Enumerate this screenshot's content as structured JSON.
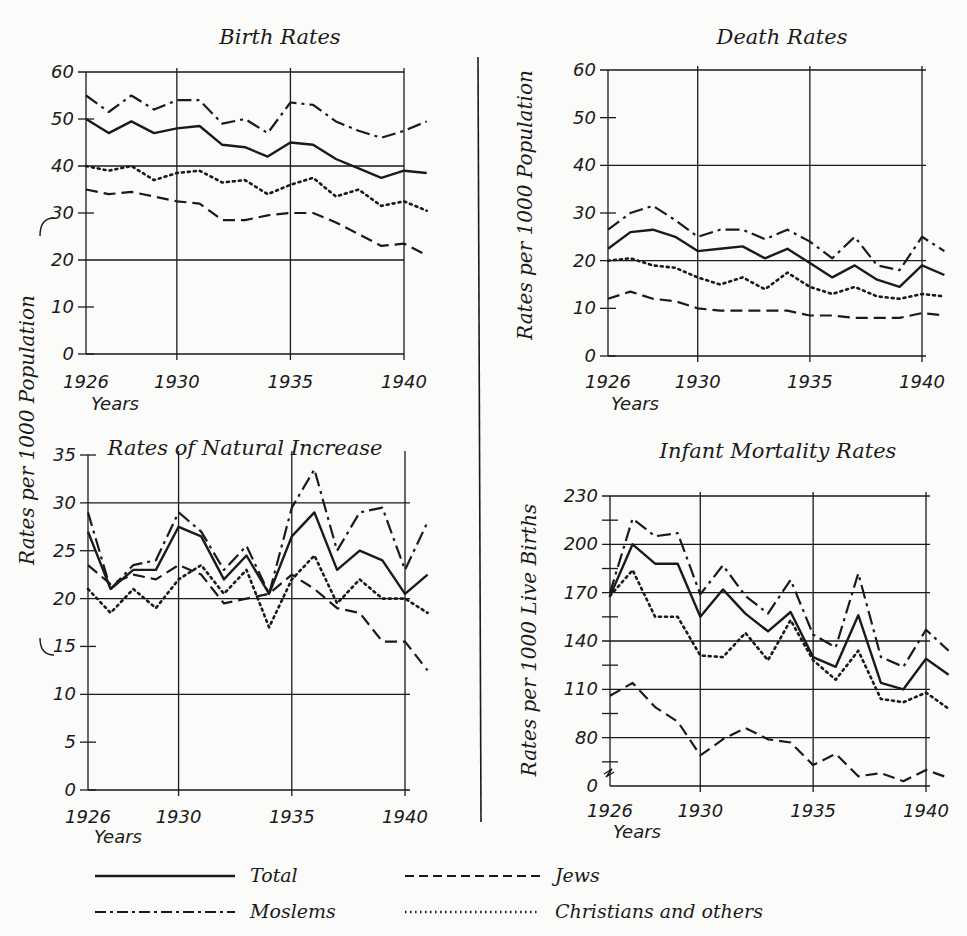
{
  "legend": [
    {
      "key": "total",
      "label": "Total",
      "style": "solid"
    },
    {
      "key": "jews",
      "label": "Jews",
      "style": "dashed"
    },
    {
      "key": "moslems",
      "label": "Moslems",
      "style": "dash-dot"
    },
    {
      "key": "christians",
      "label": "Christians and others",
      "style": "dotted"
    }
  ],
  "shared_ylabel_left": "Rates per 1000 Population",
  "chart_data": [
    {
      "type": "line",
      "title": "Birth Rates",
      "xlabel": "Years",
      "ylabel": "Rates per 1000 Population",
      "x": [
        1926,
        1927,
        1928,
        1929,
        1930,
        1931,
        1932,
        1933,
        1934,
        1935,
        1936,
        1937,
        1938,
        1939,
        1940,
        1941
      ],
      "xticks": [
        "1926",
        "1930",
        "1935",
        "1940"
      ],
      "yticks": [
        "0",
        "10",
        "20",
        "30",
        "40",
        "50",
        "60"
      ],
      "ylim": [
        0,
        60
      ],
      "series": [
        {
          "name": "Moslems",
          "values": [
            55,
            51.5,
            55,
            52,
            54,
            54,
            49,
            50,
            47,
            53.5,
            53,
            49.5,
            47.5,
            46,
            47.5,
            49.5
          ]
        },
        {
          "name": "Total",
          "values": [
            50,
            47,
            49.5,
            47,
            48,
            48.5,
            44.5,
            44,
            42,
            45,
            44.5,
            41.5,
            39.5,
            37.5,
            39,
            38.5
          ]
        },
        {
          "name": "Christians and others",
          "values": [
            40,
            39,
            40,
            37,
            38.5,
            39,
            36.5,
            37,
            34,
            36,
            37.5,
            33.5,
            35,
            31.5,
            32.5,
            30.5
          ]
        },
        {
          "name": "Jews",
          "values": [
            35,
            34,
            34.5,
            33.5,
            32.5,
            32,
            28.5,
            28.5,
            29.5,
            30,
            30,
            28,
            25.5,
            23,
            23.5,
            21
          ]
        }
      ]
    },
    {
      "type": "line",
      "title": "Death Rates",
      "xlabel": "Years",
      "ylabel": "Rates per 1000 Population",
      "x": [
        1926,
        1927,
        1928,
        1929,
        1930,
        1931,
        1932,
        1933,
        1934,
        1935,
        1936,
        1937,
        1938,
        1939,
        1940,
        1941
      ],
      "xticks": [
        "1926",
        "1930",
        "1935",
        "1940"
      ],
      "yticks": [
        "0",
        "10",
        "20",
        "30",
        "40",
        "50",
        "60"
      ],
      "ylim": [
        0,
        60
      ],
      "series": [
        {
          "name": "Moslems",
          "values": [
            26.5,
            30,
            31.5,
            28.5,
            25,
            26.5,
            26.5,
            24.5,
            26.5,
            24,
            20.5,
            25,
            19,
            18,
            25,
            22
          ]
        },
        {
          "name": "Total",
          "values": [
            22.5,
            26,
            26.5,
            25,
            22,
            22.5,
            23,
            20.5,
            22.5,
            19.5,
            16.5,
            19,
            16,
            14.5,
            19,
            17
          ]
        },
        {
          "name": "Christians and others",
          "values": [
            20,
            20.5,
            19,
            18.5,
            16.5,
            15,
            16.5,
            14,
            17.5,
            14.5,
            13,
            14.5,
            12.5,
            12,
            13,
            12.5
          ]
        },
        {
          "name": "Jews",
          "values": [
            12,
            13.5,
            12,
            11.5,
            10,
            9.5,
            9.5,
            9.5,
            9.5,
            8.5,
            8.5,
            8,
            8,
            8,
            9,
            8.5
          ]
        }
      ]
    },
    {
      "type": "line",
      "title": "Rates of Natural Increase",
      "xlabel": "Years",
      "ylabel": "Rates per 1000 Population",
      "x": [
        1926,
        1927,
        1928,
        1929,
        1930,
        1931,
        1932,
        1933,
        1934,
        1935,
        1936,
        1937,
        1938,
        1939,
        1940,
        1941
      ],
      "xticks": [
        "1926",
        "1930",
        "1935",
        "1940"
      ],
      "yticks": [
        "0",
        "5",
        "10",
        "15",
        "20",
        "25",
        "30",
        "35"
      ],
      "ylim": [
        0,
        35
      ],
      "series": [
        {
          "name": "Moslems",
          "values": [
            29,
            21,
            23.5,
            24,
            29,
            27,
            23,
            25.5,
            20.5,
            29.5,
            33.5,
            25,
            29,
            29.5,
            23,
            28
          ]
        },
        {
          "name": "Total",
          "values": [
            27,
            21,
            23,
            23,
            27.5,
            26.5,
            22,
            24.5,
            20.5,
            26.5,
            29,
            23,
            25,
            24,
            20.5,
            22.5
          ]
        },
        {
          "name": "Jews",
          "values": [
            23.5,
            21.5,
            22.5,
            22,
            23.5,
            22.5,
            19.5,
            20,
            20.5,
            22.5,
            21,
            19,
            18.5,
            15.5,
            15.5,
            12.5
          ]
        },
        {
          "name": "Christians and others",
          "values": [
            21,
            18.5,
            21,
            19,
            22,
            23.5,
            20.5,
            23,
            17,
            22,
            24.5,
            19.5,
            22,
            20,
            20,
            18.5
          ]
        }
      ]
    },
    {
      "type": "line",
      "title": "Infant Mortality Rates",
      "xlabel": "Years",
      "ylabel": "Rates per 1000 Live Births",
      "x": [
        1926,
        1927,
        1928,
        1929,
        1930,
        1931,
        1932,
        1933,
        1934,
        1935,
        1936,
        1937,
        1938,
        1939,
        1940,
        1941
      ],
      "xticks": [
        "1926",
        "1930",
        "1935",
        "1940"
      ],
      "yticks": [
        "0",
        "80",
        "110",
        "140",
        "170",
        "200",
        "230"
      ],
      "ylim": [
        50,
        230
      ],
      "axis_break": true,
      "series": [
        {
          "name": "Moslems",
          "values": [
            170,
            216,
            205,
            207,
            169,
            187,
            168,
            157,
            178,
            144,
            136,
            182,
            130,
            124,
            147,
            134
          ]
        },
        {
          "name": "Total",
          "values": [
            168,
            200,
            188,
            188,
            155,
            172,
            157,
            146,
            158,
            130,
            124,
            156,
            114,
            110,
            129,
            119
          ]
        },
        {
          "name": "Christians and others",
          "values": [
            168,
            184,
            155,
            155,
            131,
            130,
            145,
            128,
            153,
            128,
            116,
            134,
            104,
            102,
            108,
            98
          ]
        },
        {
          "name": "Jews",
          "values": [
            106,
            114,
            99,
            90,
            69,
            79,
            86,
            79,
            77,
            63,
            70,
            56,
            58,
            53,
            60,
            55
          ]
        }
      ]
    }
  ]
}
